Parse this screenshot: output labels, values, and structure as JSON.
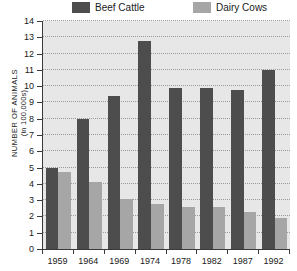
{
  "chart_data": {
    "type": "bar",
    "title": "",
    "xlabel": "",
    "ylabel": "NUMBER OF ANIMALS",
    "ylabel_sub": "(in 100,000s)",
    "ylim": [
      0,
      14
    ],
    "ytick_step": 1,
    "grid": true,
    "legend_position": "top",
    "categories": [
      "1959",
      "1964",
      "1969",
      "1974",
      "1978",
      "1982",
      "1987",
      "1992"
    ],
    "series": [
      {
        "name": "Beef Cattle",
        "color": "#4d4d4d",
        "values": [
          5.0,
          8.0,
          9.4,
          12.8,
          9.9,
          9.9,
          9.75,
          11.0
        ]
      },
      {
        "name": "Dairy Cows",
        "color": "#a6a6a6",
        "values": [
          4.7,
          4.1,
          3.05,
          2.75,
          2.6,
          2.55,
          2.3,
          1.9
        ]
      }
    ],
    "yticks": [
      "0",
      "1",
      "2",
      "3",
      "4",
      "5",
      "6",
      "7",
      "8",
      "9",
      "10",
      "11",
      "12",
      "13",
      "14"
    ]
  },
  "legend": {
    "beef_label": "Beef Cattle",
    "dairy_label": "Dairy Cows"
  },
  "colors": {
    "beef": "#4d4d4d",
    "dairy": "#a6a6a6",
    "plot_background": "#e7e7e7",
    "axis": "#3a3a3a",
    "gridline": "#9a9a9a"
  }
}
